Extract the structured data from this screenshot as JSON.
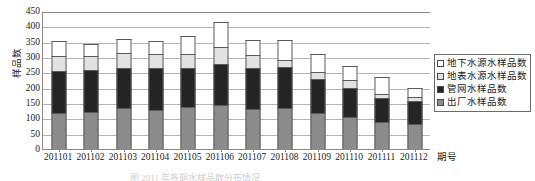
{
  "chart_data": {
    "type": "bar",
    "stacked": true,
    "title": "",
    "xlabel": "期号",
    "ylabel": "样品数",
    "ylim": [
      0,
      450
    ],
    "ytick_step": 50,
    "yticks": [
      0,
      50,
      100,
      150,
      200,
      250,
      300,
      350,
      400,
      450
    ],
    "grid": true,
    "legend_position": "right",
    "categories": [
      "201101",
      "201102",
      "201103",
      "201104",
      "201105",
      "201106",
      "201107",
      "201108",
      "201109",
      "201110",
      "201111",
      "201112"
    ],
    "series": [
      {
        "name": "出厂水样品数",
        "color": "#8c8c8c",
        "values": [
          118,
          120,
          133,
          126,
          136,
          145,
          130,
          133,
          118,
          105,
          88,
          80
        ]
      },
      {
        "name": "管网水样品数",
        "color": "#252525",
        "values": [
          137,
          138,
          132,
          138,
          129,
          133,
          135,
          134,
          110,
          95,
          77,
          75
        ]
      },
      {
        "name": "地表水源水样品数",
        "color": "#e2e2e2",
        "values": [
          50,
          45,
          48,
          45,
          46,
          54,
          42,
          23,
          22,
          25,
          13,
          15
        ]
      },
      {
        "name": "地下水源水样品数",
        "color": "#ffffff",
        "values": [
          48,
          38,
          47,
          44,
          56,
          81,
          48,
          65,
          60,
          45,
          57,
          30
        ]
      }
    ],
    "totals": [
      353,
      341,
      360,
      353,
      367,
      413,
      355,
      355,
      310,
      270,
      235,
      200
    ]
  },
  "axes": {
    "y_title": "样品数",
    "x_title": "期号"
  },
  "legend": {
    "items": [
      {
        "label": "地下水源水样品数",
        "color": "#ffffff"
      },
      {
        "label": "地表水源水样品数",
        "color": "#e2e2e2"
      },
      {
        "label": "管网水样品数",
        "color": "#252525"
      },
      {
        "label": "出厂水样品数",
        "color": "#8c8c8c"
      }
    ]
  },
  "caption": {
    "text": "图 2011 年各期水样品数分布情况"
  }
}
